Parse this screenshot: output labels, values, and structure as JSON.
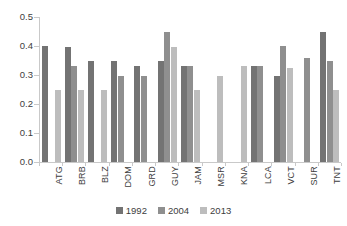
{
  "chart_data": {
    "type": "bar",
    "title": "",
    "subtitle": "",
    "xlabel": "",
    "ylabel": "",
    "ylim": [
      0.0,
      0.5
    ],
    "ytick_labels": [
      "0.0",
      "0.1",
      "0.2",
      "0.3",
      "0.4",
      "0.5"
    ],
    "ytick_values": [
      0.0,
      0.1,
      0.2,
      0.3,
      0.4,
      0.5
    ],
    "grid": false,
    "legend_position": "bottom",
    "categories": [
      "ATG",
      "BRB",
      "BLZ",
      "DOM",
      "GRD",
      "GUY",
      "JAM",
      "MSR",
      "KNA",
      "LCA",
      "VCT",
      "SUR",
      "TNT"
    ],
    "series": [
      {
        "name": "1992",
        "color": "#737373",
        "values": [
          0.4,
          0.397,
          0.348,
          0.348,
          0.33,
          0.35,
          0.332,
          null,
          null,
          0.332,
          0.298,
          null,
          0.45
        ]
      },
      {
        "name": "2004",
        "color": "#8f8f8f",
        "values": [
          null,
          0.33,
          null,
          0.298,
          0.298,
          0.447,
          0.332,
          null,
          null,
          0.332,
          0.4,
          0.36,
          0.35
        ]
      },
      {
        "name": "2013",
        "color": "#bdbdbd",
        "values": [
          0.248,
          0.248,
          0.248,
          null,
          null,
          0.398,
          0.25,
          0.298,
          0.33,
          null,
          0.325,
          null,
          0.25
        ]
      }
    ]
  },
  "legend": {
    "items": [
      {
        "label": "1992",
        "color": "#737373"
      },
      {
        "label": "2004",
        "color": "#8f8f8f"
      },
      {
        "label": "2013",
        "color": "#bdbdbd"
      }
    ]
  }
}
